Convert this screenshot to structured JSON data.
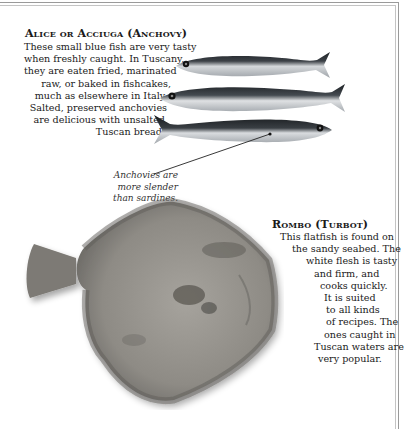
{
  "anchovy": {
    "title": "Alice or Acciuga (Anchovy)",
    "lines": [
      "These small blue fish are very tasty",
      "when freshly caught. In Tuscany,",
      "they are eaten fried, marinated",
      "raw, or baked in fishcakes,",
      "much as elsewhere in Italy.",
      "Salted, preserved anchovies",
      "are delicious with unsalted",
      "Tuscan bread."
    ],
    "caption_lines": [
      "Anchovies are",
      "more slender",
      "than sardines."
    ],
    "image_count": 3
  },
  "turbot": {
    "title": "Rombo (Turbot)",
    "lines": [
      "This flatfish is found on",
      "the sandy seabed. The",
      "white flesh is tasty",
      "and firm, and",
      "cooks quickly.",
      "It is suited",
      "to all kinds",
      "of recipes. The",
      "ones caught in",
      "Tuscan waters are",
      "very popular."
    ]
  },
  "colors": {
    "text": "#1a1a1a",
    "frame": "#9a9a9a",
    "fish_dark": "#2a2e33",
    "fish_silver": "#c9ccd0",
    "turbot_body": "#8f8c86"
  }
}
